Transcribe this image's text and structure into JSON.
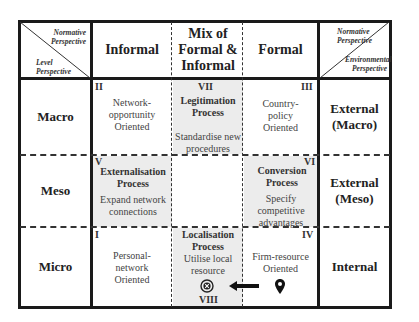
{
  "corner_left": {
    "top_label": "Normative Perspective",
    "bottom_label": "Level Perspective"
  },
  "corner_right": {
    "top_label": "Normative Perspective",
    "bottom_label": "Environmental Perspective"
  },
  "columns": [
    {
      "label": "Informal"
    },
    {
      "label": "Mix of Formal & Informal"
    },
    {
      "label": "Formal"
    }
  ],
  "rows": [
    {
      "label": "Macro",
      "environment": "External (Macro)"
    },
    {
      "label": "Meso",
      "environment": "External (Meso)"
    },
    {
      "label": "Micro",
      "environment": "Internal"
    }
  ],
  "cells": {
    "II": {
      "numeral": "II",
      "text": "Network-opportunity Oriented"
    },
    "VII": {
      "numeral": "VII",
      "process": "Legitimation Process",
      "text": "Standardise new procedures"
    },
    "III": {
      "numeral": "III",
      "text": "Country-policy Oriented"
    },
    "V": {
      "numeral": "V",
      "process": "Externalisation Process",
      "text": "Expand network connections"
    },
    "VI": {
      "numeral": "VI",
      "process": "Conversion Process",
      "text": "Specify competitive advantages"
    },
    "I": {
      "numeral": "I",
      "text": "Personal-network Oriented"
    },
    "VIII": {
      "numeral": "VIII",
      "process": "Localisation Process",
      "text": "Utilise local resource"
    },
    "IV": {
      "numeral": "IV",
      "text": "Firm-resource Oriented"
    }
  },
  "icons": {
    "target": "target-icon",
    "arrow": "arrow-left-icon",
    "pin": "location-pin-icon"
  }
}
